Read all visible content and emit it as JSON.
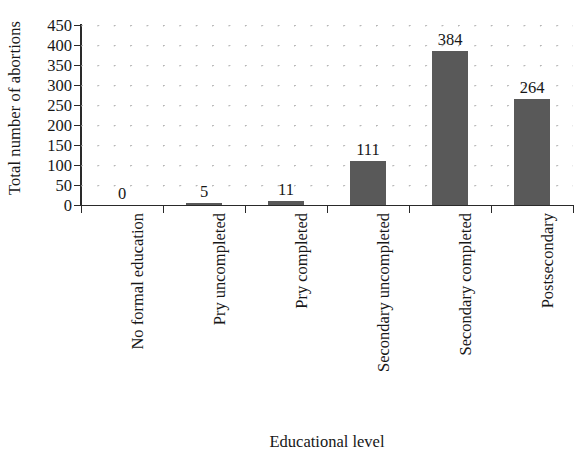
{
  "chart_data": {
    "type": "bar",
    "title": "",
    "xlabel": "Educational level",
    "ylabel": "Total number of abortions",
    "categories": [
      "No formal education",
      "Pry uncompleted",
      "Pry completed",
      "Secondary uncompleted",
      "Secondary completed",
      "Postsecondary"
    ],
    "values": [
      0,
      5,
      11,
      111,
      384,
      264
    ],
    "data_labels": [
      "0",
      "5",
      "11",
      "111",
      "384",
      "264"
    ],
    "ylim": [
      0,
      450
    ],
    "ytick_step": 50,
    "ytick_labels": [
      "450",
      "400",
      "350",
      "300",
      "250",
      "200",
      "150",
      "100",
      "50",
      "0"
    ],
    "ytick_values": [
      450,
      400,
      350,
      300,
      250,
      200,
      150,
      100,
      50,
      0
    ],
    "grid": "dotted",
    "legend": "none",
    "bar_color": "#595959",
    "axis_color": "#2a2a2a",
    "grid_color": "#9a9a9a",
    "text_color": "#171717",
    "background": "#ffffff"
  }
}
